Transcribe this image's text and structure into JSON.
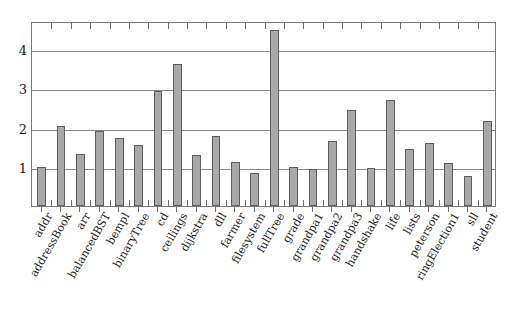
{
  "chart_data": {
    "type": "bar",
    "title": "",
    "subtitle": "",
    "xlabel": "",
    "ylabel": "",
    "ylim": [
      0,
      4.72
    ],
    "yticks": [
      1,
      2,
      3,
      4
    ],
    "ytick_labels": [
      "1",
      "2",
      "3",
      "4"
    ],
    "grid": true,
    "legend": null,
    "categories": [
      "addr",
      "addressBook",
      "arr",
      "balancedBST",
      "bempl",
      "binaryTree",
      "cd",
      "ceilings",
      "dijkstra",
      "dll",
      "farmer",
      "filesystem",
      "fullTree",
      "grade",
      "grandpa1",
      "grandpa2",
      "grandpa3",
      "handshake",
      "life",
      "lists",
      "peterson",
      "ringElection1",
      "sll",
      "student"
    ],
    "values": [
      1.0,
      2.05,
      1.32,
      1.92,
      1.74,
      1.55,
      2.93,
      3.62,
      1.31,
      1.79,
      1.12,
      0.84,
      4.5,
      1.0,
      0.95,
      1.66,
      2.45,
      0.96,
      2.7,
      1.46,
      1.61,
      1.09,
      0.77,
      2.18
    ],
    "colors": {
      "bar_fill": "#a8a8a8",
      "bar_edge": "#5e5e5e",
      "grid": "#8a8a8a",
      "frame": "#7a7a7a",
      "text": "#1a1a1a",
      "background": "#ffffff"
    }
  }
}
